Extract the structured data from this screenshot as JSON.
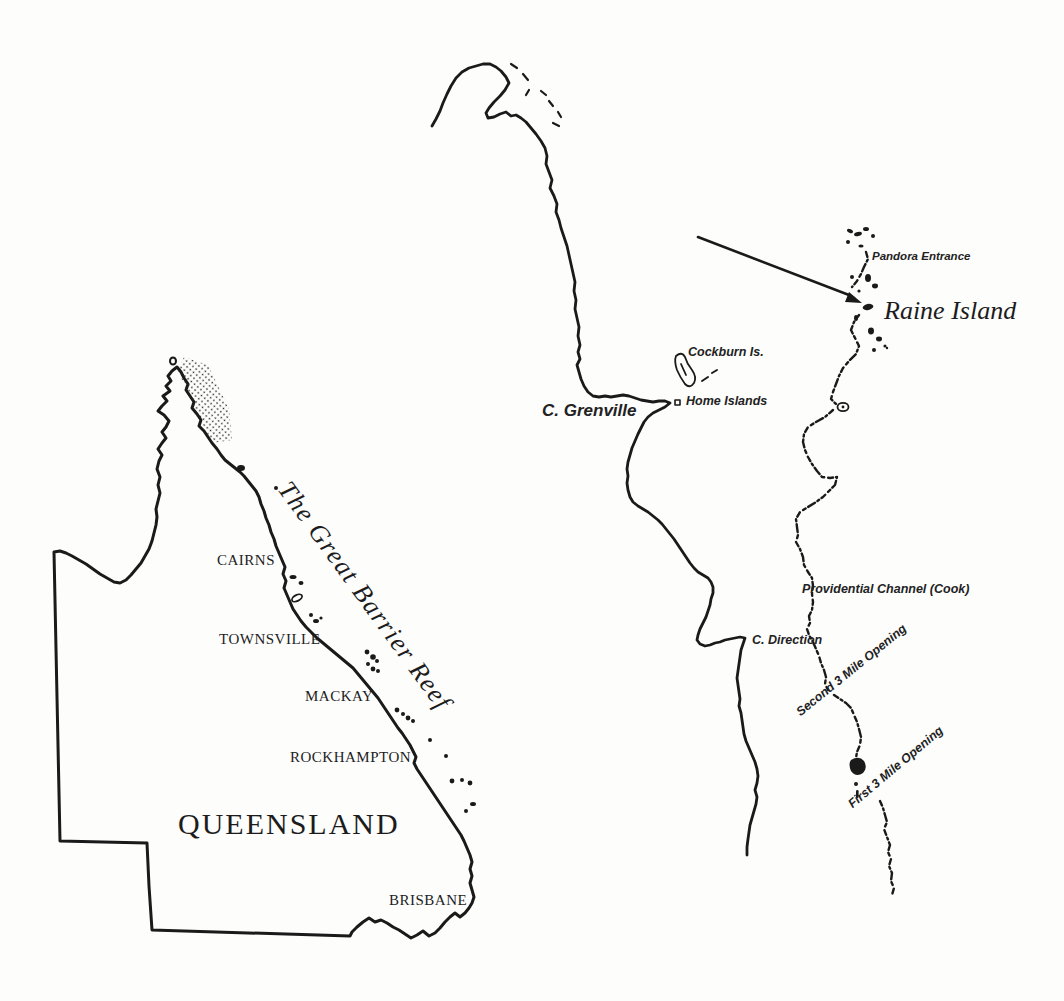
{
  "figure": {
    "ink_color": "#1a1a1a",
    "paper_color": "#fdfdfc"
  },
  "overview_map": {
    "state_label": "QUEENSLAND",
    "reef_label": "The Great Barrier Reef",
    "cities": [
      {
        "label": "CAIRNS"
      },
      {
        "label": "TOWNSVILLE"
      },
      {
        "label": "MACKAY"
      },
      {
        "label": "ROCKHAMPTON"
      },
      {
        "label": "BRISBANE"
      }
    ]
  },
  "detail_map": {
    "features": [
      {
        "label": "Pandora Entrance"
      },
      {
        "label": "Raine Island"
      },
      {
        "label": "Cockburn Is."
      },
      {
        "label": "Home Islands"
      },
      {
        "label": "C. Grenville"
      },
      {
        "label": "Providential Channel (Cook)"
      },
      {
        "label": "C. Direction"
      },
      {
        "label": "Second 3 Mile Opening"
      },
      {
        "label": "First 3 Mile Opening"
      }
    ]
  }
}
